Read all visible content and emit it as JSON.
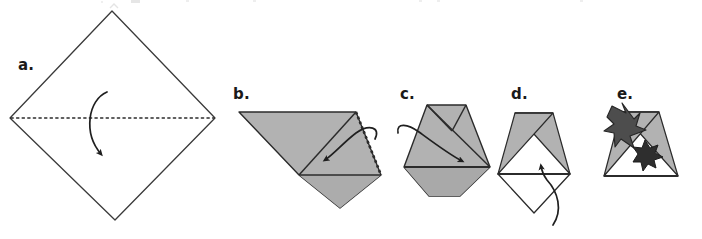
{
  "figure": {
    "width": 702,
    "height": 239,
    "background_color": "#ffffff",
    "line_color": "#2b2b2b",
    "paper_front_color": "#b2b2b2",
    "paper_shadow_color": "#9a9a9a",
    "dark_accent_color": "#4a4a4a",
    "dark_accent_color_2": "#2e2e2e",
    "cropped_caption_above": ""
  },
  "steps": [
    {
      "id": "a",
      "label": "a.",
      "label_x": 18,
      "label_y": 70,
      "description": "Square sheet rotated 45 degrees with a horizontal dashed valley-fold line across the middle and a curved arrow folding the top half down.",
      "shape": "diamond",
      "fill": "none",
      "fold_line_style": "dashed",
      "arrow": "curved-down"
    },
    {
      "id": "b",
      "label": "b.",
      "label_x": 233,
      "label_y": 99,
      "description": "Folded gray triangle with a dashed right edge and a curved arrow pointing down-left to fold the right flap over.",
      "shape": "folded-triangle",
      "fill": "gray",
      "fold_line_style": "dashed-edge",
      "arrow": "curved-left"
    },
    {
      "id": "c",
      "label": "c.",
      "label_x": 400,
      "label_y": 99,
      "description": "Gray hexagonal folded form with interior crease lines and a curved arrow sweeping from the left to the right corner.",
      "shape": "hexagon-fold",
      "fill": "gray",
      "arrow": "curved-right"
    },
    {
      "id": "d",
      "label": "d.",
      "label_x": 511,
      "label_y": 99,
      "description": "Triangle with two crossing gray flaps at the top, white center, and a white diamond flap below, with a curved arrow pointing up.",
      "shape": "crossed-flaps",
      "fill": "gray-and-white",
      "arrow": "curved-up"
    },
    {
      "id": "e",
      "label": "e.",
      "label_x": 617,
      "label_y": 99,
      "description": "Finished model: triangle with crossing gray flaps and a dark pointed dagger-and-starburst motif overlaid at the center-left.",
      "shape": "crossed-flaps-finished",
      "fill": "gray-with-dark-accent",
      "arrow": "none"
    }
  ]
}
